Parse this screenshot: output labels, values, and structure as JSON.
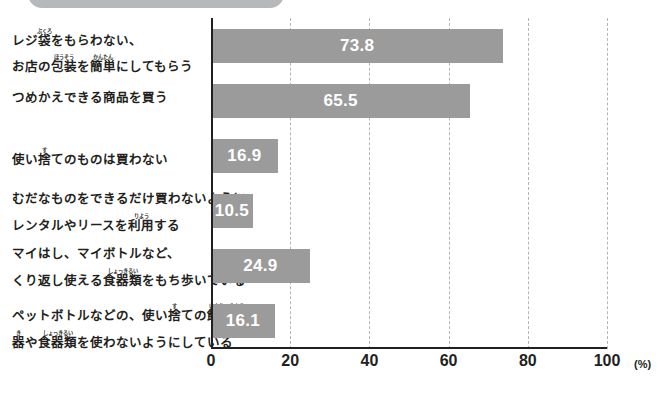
{
  "banner": {
    "label": ""
  },
  "chart_data": {
    "type": "bar",
    "orientation": "horizontal",
    "title": "",
    "xlabel": "(%)",
    "ylabel": "",
    "xlim": [
      0,
      100
    ],
    "xticks": [
      0,
      20,
      40,
      60,
      80,
      100
    ],
    "xtick_labels": [
      "0",
      "20",
      "40",
      "60",
      "80",
      "100"
    ],
    "unit_label": "(%)",
    "grid": "vertical-dashed",
    "legend": "none",
    "bar_color": "#9b9b9b",
    "value_label_color": "#ffffff",
    "axis_color": "#231f20",
    "categories": [
      "レジ袋をもらわない、お店の包装を簡単にしてもらう",
      "つめかえできる商品を買う",
      "使い捨てのものは買わない",
      "むだなものをできるだけ買わないようにレンタルやリースを利用する",
      "マイはし、マイボトルなど、くり返し使える食器類をもち歩いている",
      "ペットボトルなどの、使い捨ての飲料容器や食器類を使わないようにしている"
    ],
    "values": [
      73.8,
      65.5,
      16.9,
      10.5,
      24.9,
      16.1
    ],
    "value_labels": [
      "73.8",
      "65.5",
      "16.9",
      "10.5",
      "24.9",
      "16.1"
    ]
  },
  "categories_ruby": [
    {
      "lines": [
        [
          {
            "t": "レジ"
          },
          {
            "t": "袋",
            "rt": "ぶくろ"
          },
          {
            "t": "をもらわない、"
          }
        ],
        [
          {
            "t": "お店の"
          },
          {
            "t": "包装",
            "rt": "ほうそう"
          },
          {
            "t": "を"
          },
          {
            "t": "簡単",
            "rt": "かんたん"
          },
          {
            "t": "にしてもらう"
          }
        ]
      ]
    },
    {
      "lines": [
        [
          {
            "t": "つめかえできる商品を買う"
          }
        ]
      ]
    },
    {
      "lines": [
        [
          {
            "t": "使い"
          },
          {
            "t": "捨",
            "rt": "す"
          },
          {
            "t": "てのものは買わない"
          }
        ]
      ]
    },
    {
      "lines": [
        [
          {
            "t": "むだなものをできるだけ買わないように"
          }
        ],
        [
          {
            "t": "レンタルやリースを"
          },
          {
            "t": "利用",
            "rt": "りよう"
          },
          {
            "t": "する"
          }
        ]
      ]
    },
    {
      "lines": [
        [
          {
            "t": "マイはし、マイボトルなど、"
          }
        ],
        [
          {
            "t": "くり返し使える"
          },
          {
            "t": "食器類",
            "rt": "しょっきるい"
          },
          {
            "t": "をもち歩いている"
          }
        ]
      ]
    },
    {
      "lines": [
        [
          {
            "t": "ペットボトルなどの、使い"
          },
          {
            "t": "捨",
            "rt": "す"
          },
          {
            "t": "ての"
          },
          {
            "t": "飲料容",
            "rt": "いんりょうよう"
          }
        ],
        [
          {
            "t": "器",
            "rt": "き"
          },
          {
            "t": "や"
          },
          {
            "t": "食器類",
            "rt": "しょっきるい"
          },
          {
            "t": "を使わないようにしている"
          }
        ]
      ]
    }
  ]
}
